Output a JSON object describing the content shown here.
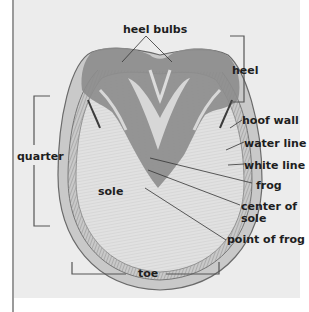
{
  "diagram": {
    "labels": {
      "heel_bulbs": "heel bulbs",
      "heel": "heel",
      "quarter": "quarter",
      "hoof_wall": "hoof wall",
      "water_line": "water line",
      "white_line": "white line",
      "frog": "frog",
      "sole": "sole",
      "center_of_sole_1": "center of",
      "center_of_sole_2": "sole",
      "point_of_frog": "point of frog",
      "toe": "toe"
    },
    "colors": {
      "panel_bg": "#ececec",
      "ink": "#1e1e1e",
      "bracket": "#555555"
    }
  }
}
